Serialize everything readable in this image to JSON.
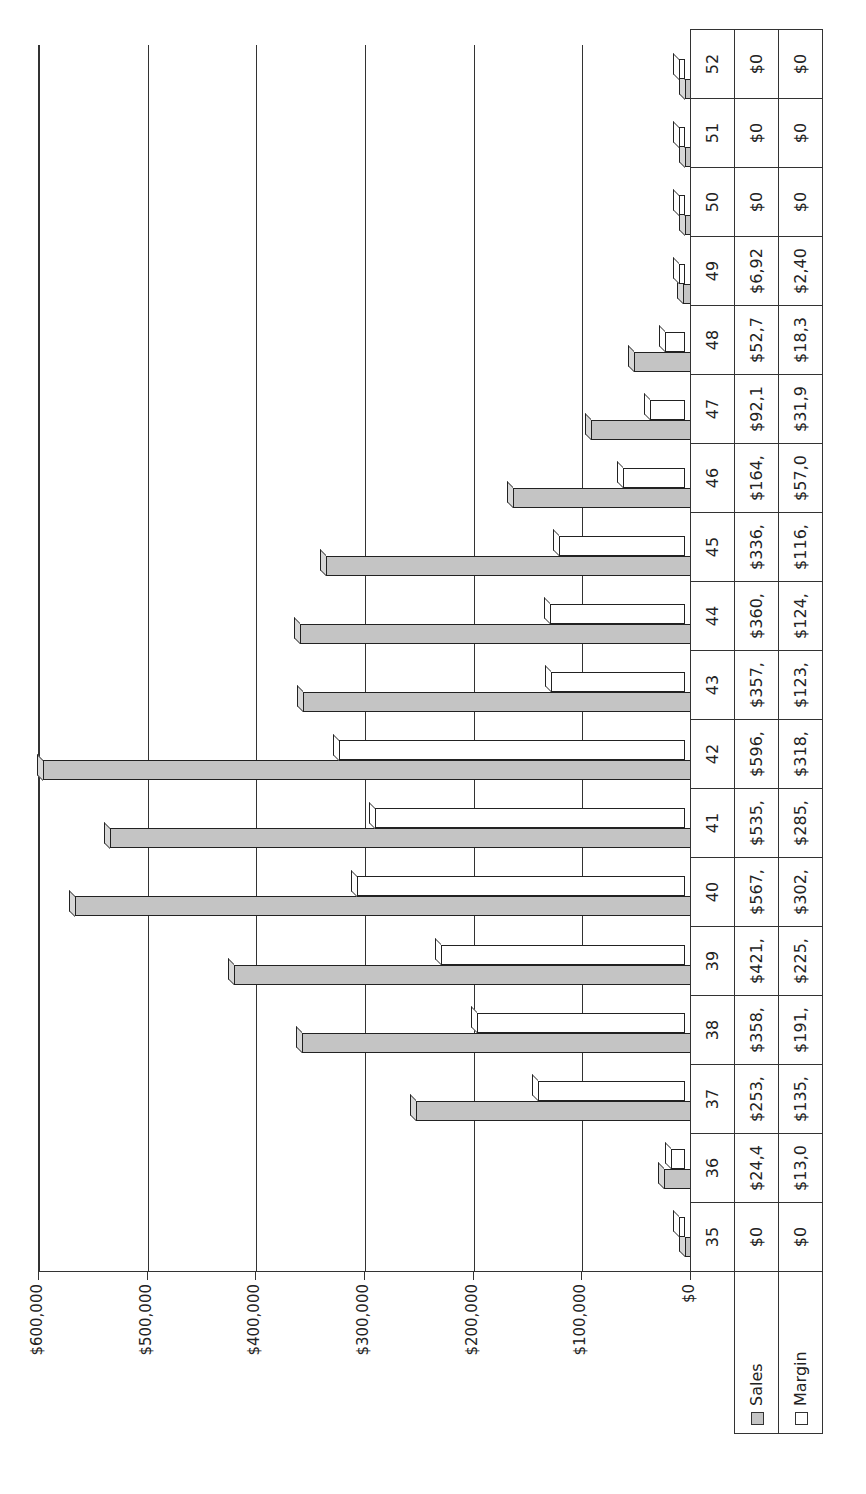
{
  "chart_data": {
    "type": "bar",
    "orientation": "rotated-90-ccw 3D clustered column with data table",
    "title": "",
    "xlabel": "Week",
    "ylabel": "",
    "ylim": [
      0,
      600000
    ],
    "yticks": [
      "$0",
      "$100,000",
      "$200,000",
      "$300,000",
      "$400,000",
      "$500,000",
      "$600,000"
    ],
    "grid": true,
    "legend_position": "data table",
    "categories": [
      "35",
      "36",
      "37",
      "38",
      "39",
      "40",
      "41",
      "42",
      "43",
      "44",
      "45",
      "46",
      "47",
      "48",
      "49",
      "50",
      "51",
      "52"
    ],
    "series": [
      {
        "name": "Sales",
        "color": "#c4c4c4",
        "values": [
          0,
          24400,
          253000,
          358000,
          421000,
          567000,
          535000,
          596000,
          357000,
          360000,
          336000,
          164000,
          92100,
          52700,
          6920,
          0,
          0,
          0
        ]
      },
      {
        "name": "Margin",
        "color": "#ffffff",
        "values": [
          0,
          13000,
          135000,
          191000,
          225000,
          302000,
          285000,
          318000,
          123000,
          124000,
          116000,
          57000,
          31900,
          18300,
          2400,
          0,
          0,
          0
        ]
      }
    ],
    "table": {
      "Sales": [
        "$0",
        "$24,4",
        "$253,",
        "$358,",
        "$421,",
        "$567,",
        "$535,",
        "$596,",
        "$357,",
        "$360,",
        "$336,",
        "$164,",
        "$92,1",
        "$52,7",
        "$6,92",
        "$0",
        "$0",
        "$0"
      ],
      "Margin": [
        "$0",
        "$13,0",
        "$135,",
        "$191,",
        "$225,",
        "$302,",
        "$285,",
        "$318,",
        "$123,",
        "$124,",
        "$116,",
        "$57,0",
        "$31,9",
        "$18,3",
        "$2,40",
        "$0",
        "$0",
        "$0"
      ]
    }
  },
  "legend": {
    "sales_label": "Sales",
    "margin_label": "Margin"
  }
}
